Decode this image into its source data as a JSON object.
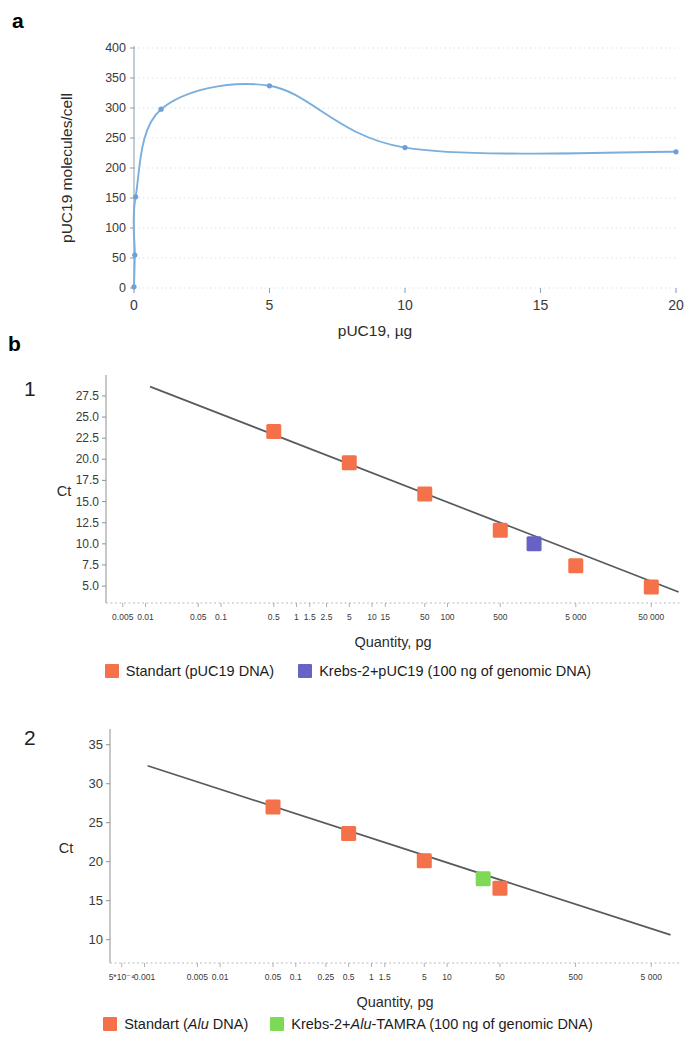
{
  "figure": {
    "panel_a_letter": "a",
    "panel_b_letter": "b",
    "sub_1": "1",
    "sub_2": "2"
  },
  "chart_data": [
    {
      "id": "panel-a",
      "type": "line",
      "title": "",
      "xlabel": "pUC19, µg",
      "ylabel": "pUC19 molecules/cell",
      "xlim": [
        0,
        20
      ],
      "ylim": [
        0,
        400
      ],
      "xticks": [
        "0",
        "5",
        "10",
        "15",
        "20"
      ],
      "xtick_values": [
        0,
        5,
        10,
        15,
        20
      ],
      "yticks": [
        "0",
        "50",
        "100",
        "150",
        "200",
        "250",
        "300",
        "350",
        "400"
      ],
      "ytick_values": [
        0,
        50,
        100,
        150,
        200,
        250,
        300,
        350,
        400
      ],
      "grid": true,
      "series_color": "#7aaedc",
      "marker_color": "#6f9fd8",
      "points": [
        {
          "x": 0.0,
          "y": 2
        },
        {
          "x": 0.03,
          "y": 55
        },
        {
          "x": 0.06,
          "y": 152
        },
        {
          "x": 1.0,
          "y": 298
        },
        {
          "x": 5.0,
          "y": 337
        },
        {
          "x": 10.0,
          "y": 234
        },
        {
          "x": 20.0,
          "y": 227
        }
      ],
      "legend": null
    },
    {
      "id": "panel-b1",
      "type": "scatter",
      "title": "",
      "xlabel": "Quantity, pg",
      "ylabel": "Ct",
      "xscale": "log",
      "xlim": [
        0.003,
        120000
      ],
      "ylim": [
        3.0,
        29.5
      ],
      "xticks": [
        "0.005",
        "0.01",
        "0.05",
        "0.1",
        "0.5",
        "1",
        "1.5",
        "2.5",
        "5",
        "10",
        "15",
        "50",
        "100",
        "500",
        "5 000",
        "50 000"
      ],
      "xtick_values": [
        0.005,
        0.01,
        0.05,
        0.1,
        0.5,
        1,
        1.5,
        2.5,
        5,
        10,
        15,
        50,
        100,
        500,
        5000,
        50000
      ],
      "yticks": [
        "27.5",
        "25.0",
        "22.5",
        "20.0",
        "17.5",
        "15.0",
        "12.5",
        "10.0",
        "7.5",
        "5.0"
      ],
      "ytick_values": [
        27.5,
        25.0,
        22.5,
        20.0,
        17.5,
        15.0,
        12.5,
        10.0,
        7.5,
        5.0
      ],
      "grid": false,
      "fit_line": {
        "color": "#555b60",
        "x_start": 0.0115,
        "y_start": 28.6,
        "x_end": 115000,
        "y_end": 4.3
      },
      "series": [
        {
          "name": "Standart (pUC19 DNA)",
          "color": "#f4714a",
          "marker": "square",
          "points": [
            {
              "x": 0.5,
              "y": 23.3
            },
            {
              "x": 5,
              "y": 19.6
            },
            {
              "x": 50,
              "y": 15.9
            },
            {
              "x": 500,
              "y": 11.6
            },
            {
              "x": 5000,
              "y": 7.4
            },
            {
              "x": 50000,
              "y": 4.9
            }
          ]
        },
        {
          "name": "Krebs-2+pUC19 (100 ng of genomic DNA)",
          "color": "#6862c4",
          "marker": "square",
          "points": [
            {
              "x": 1400,
              "y": 10.0
            }
          ]
        }
      ],
      "legend": {
        "position": "bottom",
        "entries": [
          {
            "label_prefix": "Standart (pUC19 DNA)",
            "label_italic": "",
            "label_suffix": "",
            "color": "#f4714a"
          },
          {
            "label_prefix": "Krebs-2+pUC19 (100 ng of genomic DNA)",
            "label_italic": "",
            "label_suffix": "",
            "color": "#6862c4"
          }
        ]
      }
    },
    {
      "id": "panel-b2",
      "type": "scatter",
      "title": "",
      "xlabel": "Quantity, pg",
      "ylabel": "Ct",
      "xscale": "log",
      "xlim": [
        0.00035,
        12000
      ],
      "ylim": [
        7.0,
        36.5
      ],
      "xticks": [
        "5*10⁻⁴",
        "0.001",
        "0.005",
        "0.01",
        "0.05",
        "0.1",
        "0.25",
        "0.5",
        "1",
        "1.5",
        "5",
        "10",
        "50",
        "500",
        "5 000"
      ],
      "xtick_values": [
        0.0005,
        0.001,
        0.005,
        0.01,
        0.05,
        0.1,
        0.25,
        0.5,
        1,
        1.5,
        5,
        10,
        50,
        500,
        5000
      ],
      "yticks": [
        "35",
        "30",
        "25",
        "20",
        "15",
        "10"
      ],
      "ytick_values": [
        35,
        30,
        25,
        20,
        15,
        10
      ],
      "grid": false,
      "fit_line": {
        "color": "#555b60",
        "x_start": 0.0011,
        "y_start": 32.3,
        "x_end": 9000,
        "y_end": 10.6
      },
      "series": [
        {
          "name": "Standart (Alu DNA)",
          "color": "#f4714a",
          "marker": "square",
          "points": [
            {
              "x": 0.05,
              "y": 27.0
            },
            {
              "x": 0.5,
              "y": 23.6
            },
            {
              "x": 5,
              "y": 20.1
            },
            {
              "x": 50,
              "y": 16.6
            }
          ]
        },
        {
          "name": "Krebs-2+Alu-TAMRA (100 ng of genomic DNA)",
          "color": "#7ed957",
          "marker": "square",
          "points": [
            {
              "x": 30,
              "y": 17.8
            }
          ]
        }
      ],
      "legend": {
        "position": "bottom",
        "entries": [
          {
            "label_prefix": "Standart (",
            "label_italic": "Alu",
            "label_suffix": " DNA)",
            "color": "#f4714a"
          },
          {
            "label_prefix": "Krebs-2+",
            "label_italic": "Alu",
            "label_suffix": "-TAMRA (100 ng of genomic DNA)",
            "color": "#7ed957"
          }
        ]
      }
    }
  ]
}
